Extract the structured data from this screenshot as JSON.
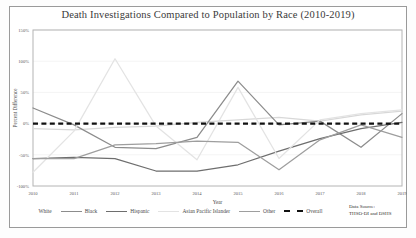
{
  "figure": {
    "title": "Death Investigations Compared to Population by Race (2010-2019)",
    "data_source_line1": "Data Source:",
    "data_source_line2": "THSO-DI and DSHS"
  },
  "chart_data": {
    "type": "line",
    "title": "Death Investigations Compared to Population by Race (2010-2019)",
    "xlabel": "Year",
    "ylabel": "Percent Difference",
    "x": [
      2010,
      2011,
      2012,
      2013,
      2014,
      2015,
      2016,
      2017,
      2018,
      2019
    ],
    "xtick_labels": [
      "2010",
      "2011",
      "2012",
      "2013",
      "2014",
      "2015",
      "2016",
      "2017",
      "2018",
      "2019"
    ],
    "ytick_labels": [
      "150%",
      "100%",
      "50%",
      "0%",
      "-50%",
      "-100%"
    ],
    "ytick_values": [
      150,
      100,
      50,
      0,
      -50,
      -100
    ],
    "ylim": [
      -100,
      150
    ],
    "xlim": [
      2010,
      2019
    ],
    "grid": true,
    "legend_position": "bottom",
    "series": [
      {
        "name": "White",
        "color": "#d8d8d8",
        "values": [
          -8,
          -10,
          -6,
          -4,
          2,
          6,
          10,
          4,
          14,
          20
        ]
      },
      {
        "name": "Black",
        "color": "#8c8c8c",
        "values": [
          25,
          -2,
          -38,
          -40,
          -22,
          68,
          -2,
          4,
          -38,
          16
        ]
      },
      {
        "name": "Hispanic",
        "color": "#6e6e6e",
        "values": [
          -56,
          -54,
          -56,
          -76,
          -76,
          -66,
          -44,
          -24,
          -8,
          2
        ]
      },
      {
        "name": "Asian Pacific Islander",
        "color": "#e3e3e3",
        "values": [
          -78,
          -12,
          104,
          -4,
          -58,
          58,
          -56,
          6,
          16,
          22
        ]
      },
      {
        "name": "Other",
        "color": "#9e9e9e",
        "values": [
          -56,
          -56,
          -34,
          -32,
          -28,
          -30,
          -74,
          -26,
          -2,
          -22
        ]
      },
      {
        "name": "Overall",
        "color": "#111111",
        "values": [
          0,
          0,
          0,
          0,
          0,
          0,
          0,
          0,
          0,
          0
        ]
      }
    ]
  }
}
